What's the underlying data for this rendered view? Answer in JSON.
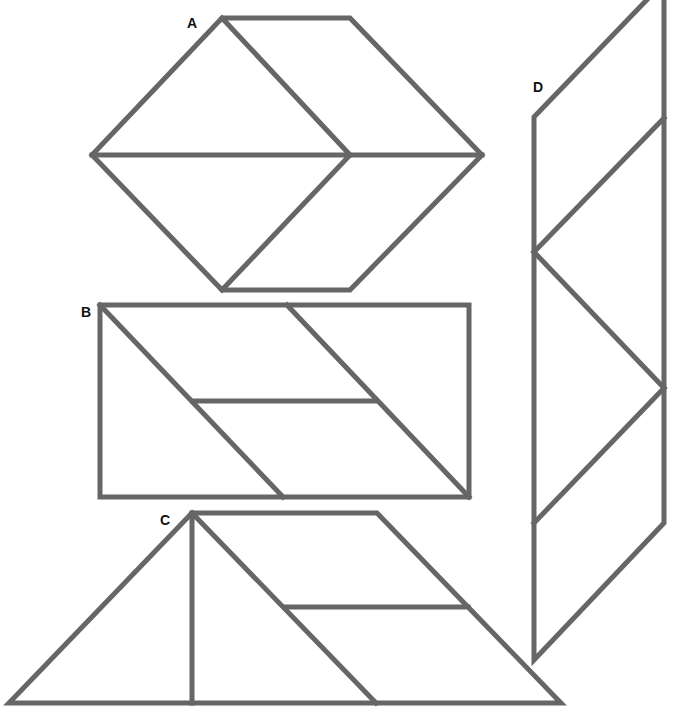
{
  "diagram": {
    "title": "",
    "stroke_color": "#666666",
    "label_color": "#111111",
    "background": "#ffffff",
    "figures": [
      {
        "id": "A",
        "label": "A",
        "label_pos": [
          187,
          28
        ],
        "outline": [
          [
            222,
            18
          ],
          [
            350,
            18
          ],
          [
            482,
            155
          ],
          [
            350,
            290
          ],
          [
            222,
            290
          ],
          [
            92,
            155
          ]
        ],
        "segments": [
          [
            [
              92,
              155
            ],
            [
              482,
              155
            ]
          ],
          [
            [
              222,
              18
            ],
            [
              350,
              155
            ]
          ],
          [
            [
              350,
              155
            ],
            [
              222,
              290
            ]
          ]
        ]
      },
      {
        "id": "B",
        "label": "B",
        "label_pos": [
          81,
          317
        ],
        "outline": [
          [
            100,
            305
          ],
          [
            469,
            305
          ],
          [
            469,
            497
          ],
          [
            100,
            497
          ]
        ],
        "segments": [
          [
            [
              100,
              305
            ],
            [
              283,
              497
            ]
          ],
          [
            [
              287,
              305
            ],
            [
              469,
              497
            ]
          ],
          [
            [
              193,
              401
            ],
            [
              376,
              401
            ]
          ]
        ]
      },
      {
        "id": "C",
        "label": "C",
        "label_pos": [
          160,
          525
        ],
        "outline": [
          [
            192,
            513
          ],
          [
            377,
            513
          ],
          [
            561,
            703
          ],
          [
            9,
            703
          ]
        ],
        "segments": [
          [
            [
              192,
              513
            ],
            [
              192,
              703
            ]
          ],
          [
            [
              192,
              513
            ],
            [
              376,
              703
            ]
          ],
          [
            [
              285,
              607
            ],
            [
              468,
              607
            ]
          ]
        ]
      },
      {
        "id": "D",
        "label": "D",
        "label_pos": [
          533,
          92
        ],
        "outline": [
          [
            534,
            117
          ],
          [
            664,
            -18
          ],
          [
            664,
            523
          ],
          [
            534,
            660
          ]
        ],
        "segments": [
          [
            [
              534,
              252
            ],
            [
              664,
              118
            ]
          ],
          [
            [
              534,
              252
            ],
            [
              664,
              388
            ]
          ],
          [
            [
              534,
              523
            ],
            [
              664,
              388
            ]
          ]
        ]
      }
    ]
  }
}
